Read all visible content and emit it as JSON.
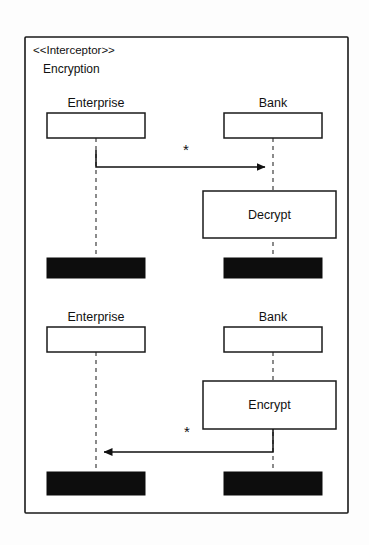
{
  "diagram": {
    "kind": "uml-sequence-diagram",
    "stereotype": "<<Interceptor>>",
    "name": "Encryption",
    "colors": {
      "line": "#111111",
      "lifeline": "#4d4d4d",
      "fill": "#ffffff",
      "termination": "#0d0d0d",
      "background": "#fdfdfd"
    },
    "frame": {
      "x": 25,
      "y": 37,
      "width": 323,
      "height": 476
    },
    "sections": [
      {
        "id": "decrypt-section",
        "participants": [
          {
            "id": "enterprise-1",
            "label": "Enterprise",
            "box": {
              "x": 47,
              "y": 113,
              "width": 98,
              "height": 25
            },
            "lifeline_x": 96,
            "lifeline_y1": 138,
            "lifeline_y2": 258
          },
          {
            "id": "bank-1",
            "label": "Bank",
            "box": {
              "x": 224,
              "y": 113,
              "width": 98,
              "height": 25
            },
            "lifeline_x": 273,
            "lifeline_y1": 138,
            "lifeline_y2": 258
          }
        ],
        "messages": [
          {
            "id": "message-enterprise-to-bank",
            "multiplicity": "*",
            "multiplicity_x": 186,
            "multiplicity_y": 155,
            "direction": "right",
            "from_x": 96,
            "to_x": 273,
            "y": 167,
            "stem_y": 150
          }
        ],
        "activations": [
          {
            "id": "decrypt-activation",
            "label": "Decrypt",
            "box": {
              "x": 203,
              "y": 191,
              "width": 133,
              "height": 47
            }
          }
        ],
        "terminations": [
          {
            "id": "enterprise-1-termination",
            "box": {
              "x": 47,
              "y": 258,
              "width": 98,
              "height": 20
            }
          },
          {
            "id": "bank-1-termination",
            "box": {
              "x": 224,
              "y": 258,
              "width": 98,
              "height": 20
            }
          }
        ]
      },
      {
        "id": "encrypt-section",
        "participants": [
          {
            "id": "enterprise-2",
            "label": "Enterprise",
            "box": {
              "x": 47,
              "y": 327,
              "width": 98,
              "height": 25
            },
            "lifeline_x": 96,
            "lifeline_y1": 352,
            "lifeline_y2": 472
          },
          {
            "id": "bank-2",
            "label": "Bank",
            "box": {
              "x": 224,
              "y": 327,
              "width": 98,
              "height": 25
            },
            "lifeline_x": 273,
            "lifeline_y1": 352,
            "lifeline_y2": 472
          }
        ],
        "messages": [
          {
            "id": "message-bank-to-enterprise",
            "multiplicity": "*",
            "multiplicity_x": 187,
            "multiplicity_y": 437,
            "direction": "left",
            "from_x": 273,
            "to_x": 96,
            "y": 452,
            "stem_y": 429
          }
        ],
        "activations": [
          {
            "id": "encrypt-activation",
            "label": "Encrypt",
            "box": {
              "x": 203,
              "y": 381,
              "width": 133,
              "height": 48
            }
          }
        ],
        "terminations": [
          {
            "id": "enterprise-2-termination",
            "box": {
              "x": 47,
              "y": 472,
              "width": 98,
              "height": 23
            }
          },
          {
            "id": "bank-2-termination",
            "box": {
              "x": 224,
              "y": 472,
              "width": 98,
              "height": 23
            }
          }
        ]
      }
    ],
    "labels": {
      "stereotype_x": 33,
      "stereotype_y": 54,
      "name_x": 43,
      "name_y": 73
    }
  }
}
